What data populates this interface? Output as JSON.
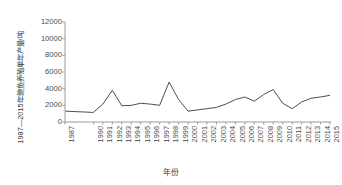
{
  "chart_data": {
    "type": "line",
    "title": "",
    "xlabel": "年份",
    "ylabel": "1987—2015年鲍鱼养殖单年产量/吨",
    "ylim": [
      0,
      12000
    ],
    "yticks": [
      0,
      2000,
      4000,
      6000,
      8000,
      10000,
      12000
    ],
    "ytick_labels": [
      "0",
      "2000",
      "4000",
      "6000",
      "8000",
      "10000",
      "12000"
    ],
    "grid": false,
    "legend": "none",
    "line_color": "#4d4d4d",
    "line_width": 1.0,
    "categories": [
      "1987",
      "1990",
      "1991",
      "1992",
      "1993",
      "1994",
      "1995",
      "1996",
      "1997",
      "1998",
      "1999",
      "2000",
      "2001",
      "2002",
      "2003",
      "2004",
      "2005",
      "2006",
      "2007",
      "2008",
      "2009",
      "2010",
      "2011",
      "2012",
      "2013",
      "2014",
      "2015"
    ],
    "xtick_labels": [
      "1987",
      "1990",
      "1991",
      "1992",
      "1993",
      "1994",
      "1995",
      "1996",
      "1997",
      "1998",
      "1999",
      "2000",
      "2001",
      "2002",
      "2003",
      "2004",
      "2005",
      "2006",
      "2007",
      "2008",
      "2009",
      "2010",
      "2011",
      "2012",
      "2013",
      "2014",
      "2015"
    ],
    "series": [
      {
        "name": "鲍鱼养殖单年产量",
        "values": [
          1300,
          1150,
          2150,
          3800,
          1950,
          2000,
          2250,
          2150,
          2000,
          4800,
          2700,
          1300,
          1450,
          1600,
          1750,
          2150,
          2700,
          3000,
          2500,
          3300,
          3900,
          2250,
          1600,
          2400,
          2850,
          3000,
          3200
        ]
      }
    ],
    "series_tail": {
      "note": "final rise",
      "values": [
        3900,
        6200,
        9200,
        10450,
        10300
      ]
    }
  }
}
